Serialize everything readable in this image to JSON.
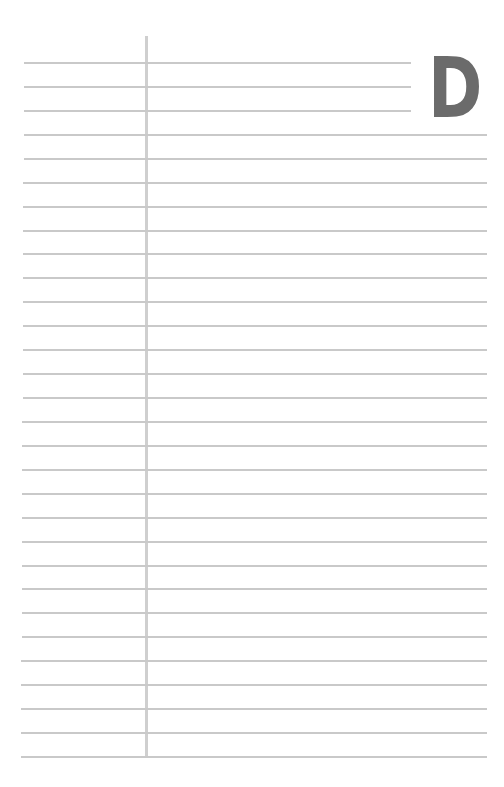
{
  "page": {
    "type": "address-book-page",
    "tab_letter": "D",
    "line_count": 30,
    "colors": {
      "background": "#ffffff",
      "rule_line": "#c9c9c9",
      "margin_line": "#cfcfcf",
      "tab_letter": "#6b6b6b"
    }
  }
}
